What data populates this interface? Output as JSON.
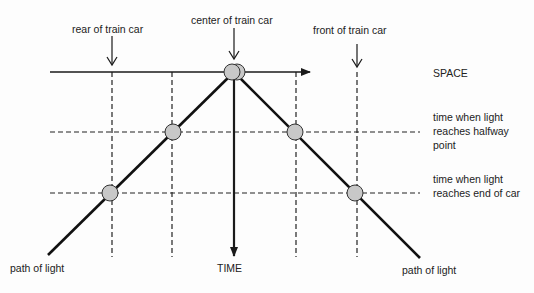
{
  "diagram": {
    "labels": {
      "rear": "rear of train car",
      "center": "center of train car",
      "front": "front of train car",
      "space_axis": "SPACE",
      "time_axis": "TIME",
      "halfway": "time when light reaches halfway point",
      "end": "time when light reaches end of car",
      "light_left": "path of light",
      "light_right": "path of light"
    },
    "colors": {
      "line": "#1a1a1a",
      "circle_fill": "#c8c8c8",
      "circle_stroke": "#333333",
      "background": "#fdfdfd"
    }
  }
}
